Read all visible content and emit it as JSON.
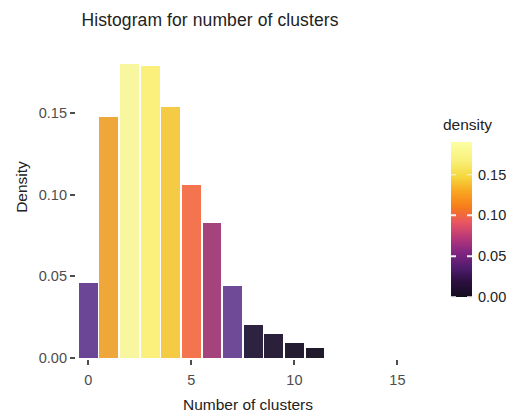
{
  "chart_data": {
    "type": "bar",
    "title": "Histogram for number of clusters",
    "xlabel": "Number of clusters",
    "ylabel": "Density",
    "categories": [
      0,
      1,
      2,
      3,
      4,
      5,
      6,
      7,
      8,
      9,
      10,
      11
    ],
    "values": [
      0.046,
      0.148,
      0.18,
      0.179,
      0.154,
      0.106,
      0.083,
      0.044,
      0.02,
      0.0145,
      0.0095,
      0.006
    ],
    "bar_colors": [
      "#6b4596",
      "#f0a73a",
      "#f8f7a0",
      "#fbf07c",
      "#f5cb45",
      "#f3744f",
      "#a4437c",
      "#6f4a97",
      "#2d2240",
      "#2a2039",
      "#241c31",
      "#211a2d"
    ],
    "xlim": [
      -0.5,
      16.0
    ],
    "ylim": [
      0.0,
      0.19
    ],
    "xticks": [
      0,
      5,
      10,
      15
    ],
    "xtick_labels": [
      "0",
      "5",
      "10",
      "15"
    ],
    "yticks": [
      0.0,
      0.05,
      0.1,
      0.15
    ],
    "ytick_labels": [
      "0.00",
      "0.05",
      "0.10",
      "0.15"
    ],
    "grid": false,
    "legend": {
      "title": "density",
      "position": "right",
      "type": "continuous-colorbar",
      "colormap": "inferno",
      "range": [
        0.0,
        0.19
      ],
      "tick_values": [
        0.0,
        0.05,
        0.1,
        0.15
      ],
      "tick_labels": [
        "0.00",
        "0.05",
        "0.10",
        "0.15"
      ],
      "gradient_stops": [
        {
          "pos": 0,
          "color": "#fcffa4"
        },
        {
          "pos": 12,
          "color": "#f9f07a"
        },
        {
          "pos": 22,
          "color": "#f5d93f"
        },
        {
          "pos": 32,
          "color": "#f9a621"
        },
        {
          "pos": 42,
          "color": "#f67c19"
        },
        {
          "pos": 52,
          "color": "#e95562"
        },
        {
          "pos": 62,
          "color": "#b63779"
        },
        {
          "pos": 72,
          "color": "#7d2482"
        },
        {
          "pos": 82,
          "color": "#4d1b6b"
        },
        {
          "pos": 90,
          "color": "#2c1040"
        },
        {
          "pos": 100,
          "color": "#130c1e"
        }
      ]
    }
  },
  "panel": {
    "background": "#ffffff",
    "axis_color": "#4d4d4d",
    "text_color": "#222222"
  }
}
